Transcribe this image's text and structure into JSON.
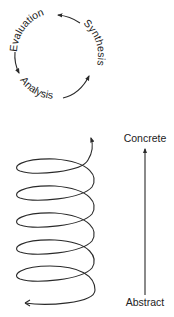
{
  "cycle_diagram": {
    "labels": {
      "evaluation": "Evaluation",
      "synthesis": "Synthesis",
      "analysis": "Analysis"
    },
    "direction": "counter-clockwise"
  },
  "spiral_diagram": {
    "loops": 5,
    "axis": {
      "top_label": "Concrete",
      "bottom_label": "Abstract"
    }
  }
}
